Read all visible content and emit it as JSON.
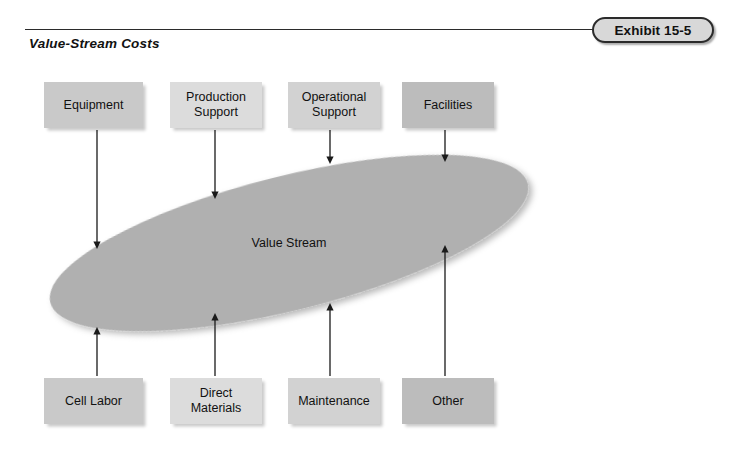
{
  "exhibit": {
    "badge_label": "Exhibit 15-5",
    "figure_title": "Value-Stream Costs"
  },
  "diagram": {
    "center_label": "Value Stream",
    "ellipse": {
      "fill_color": "#b0b0b0",
      "rotation_deg": -14,
      "cx": 289,
      "cy": 243,
      "rx": 246,
      "ry": 67
    },
    "top_boxes": [
      {
        "label": "Equipment",
        "lines": [
          "Equipment"
        ],
        "fill_color": "#c9c9c9",
        "x": 44,
        "y": 82,
        "w": 99,
        "h": 46,
        "arrow_x": 97,
        "arrow_from_y": 130,
        "arrow_to_y": 249
      },
      {
        "label": "Production Support",
        "lines": [
          "Production",
          "Support"
        ],
        "fill_color": "#dcdcdc",
        "x": 170,
        "y": 82,
        "w": 92,
        "h": 46,
        "arrow_x": 215,
        "arrow_from_y": 130,
        "arrow_to_y": 199
      },
      {
        "label": "Operational Support",
        "lines": [
          "Operational",
          "Support"
        ],
        "fill_color": "#d2d2d2",
        "x": 288,
        "y": 82,
        "w": 92,
        "h": 46,
        "arrow_x": 330,
        "arrow_from_y": 130,
        "arrow_to_y": 164
      },
      {
        "label": "Facilities",
        "lines": [
          "Facilities"
        ],
        "fill_color": "#bcbcbc",
        "x": 402,
        "y": 82,
        "w": 92,
        "h": 46,
        "arrow_x": 445,
        "arrow_from_y": 130,
        "arrow_to_y": 162
      }
    ],
    "bottom_boxes": [
      {
        "label": "Cell Labor",
        "lines": [
          "Cell Labor"
        ],
        "fill_color": "#c9c9c9",
        "x": 44,
        "y": 378,
        "w": 99,
        "h": 46,
        "arrow_x": 97,
        "arrow_from_y": 376,
        "arrow_to_y": 327
      },
      {
        "label": "Direct Materials",
        "lines": [
          "Direct",
          "Materials"
        ],
        "fill_color": "#dcdcdc",
        "x": 170,
        "y": 378,
        "w": 92,
        "h": 46,
        "arrow_x": 215,
        "arrow_from_y": 376,
        "arrow_to_y": 313
      },
      {
        "label": "Maintenance",
        "lines": [
          "Maintenance"
        ],
        "fill_color": "#d2d2d2",
        "x": 288,
        "y": 378,
        "w": 92,
        "h": 46,
        "arrow_x": 330,
        "arrow_from_y": 376,
        "arrow_to_y": 303
      },
      {
        "label": "Other",
        "lines": [
          "Other"
        ],
        "fill_color": "#bcbcbc",
        "x": 402,
        "y": 378,
        "w": 92,
        "h": 46,
        "arrow_x": 445,
        "arrow_from_y": 376,
        "arrow_to_y": 245
      }
    ]
  }
}
